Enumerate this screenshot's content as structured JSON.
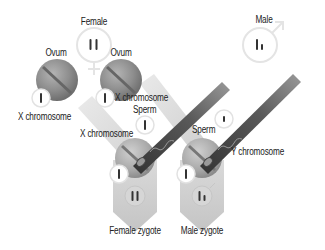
{
  "diagram": {
    "labels": {
      "female": "Female",
      "male": "Male",
      "ovum_left": "Ovum",
      "ovum_right": "Ovum",
      "x_chromosome_left": "X chromosome",
      "x_chromosome_right": "X chromosome",
      "x_chromosome_sperm": "X chromosome",
      "sperm_left": "Sperm",
      "sperm_right": "Sperm",
      "y_chromosome": "Y chromosome",
      "female_zygote": "Female zygote",
      "male_zygote": "Male zygote"
    },
    "nodes": [
      {
        "id": "female-parent",
        "symbol": "female-symbol",
        "chromosomes": "XX"
      },
      {
        "id": "male-parent",
        "symbol": "male-symbol",
        "chromosomes": "XY"
      },
      {
        "id": "ovum-left",
        "chromosome": "X"
      },
      {
        "id": "ovum-right",
        "chromosome": "X"
      },
      {
        "id": "sperm-x",
        "chromosome": "X"
      },
      {
        "id": "sperm-y",
        "chromosome": "Y"
      },
      {
        "id": "female-zygote",
        "chromosomes": "XX",
        "symbol": "female-symbol"
      },
      {
        "id": "male-zygote",
        "chromosomes": "XY",
        "symbol": "male-symbol"
      }
    ],
    "edges": [
      {
        "from": "ovum-left",
        "to": "female-zygote"
      },
      {
        "from": "ovum-right",
        "to": "male-zygote"
      },
      {
        "from": "sperm-x",
        "to": "female-zygote"
      },
      {
        "from": "sperm-y",
        "to": "male-zygote"
      }
    ],
    "colors": {
      "cell": "#8a8a8a",
      "sperm_band": "#555555",
      "ovum_band": "#d8d8d8",
      "zygote_arrow": "#cfcfcf",
      "ring": "#e6e6e6",
      "chromosome": "#333333"
    }
  }
}
